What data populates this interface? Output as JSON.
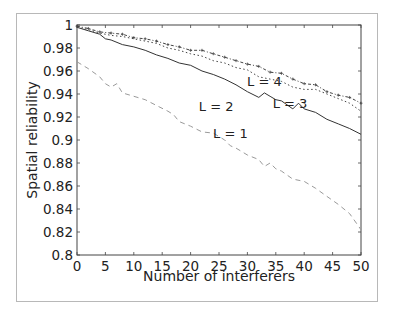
{
  "chart_data": {
    "type": "line",
    "title": "",
    "xlabel": "Number of interferers",
    "ylabel": "Spatial reliability",
    "xlim": [
      0,
      50
    ],
    "ylim": [
      0.8,
      1
    ],
    "xticks": [
      0,
      5,
      10,
      15,
      20,
      25,
      30,
      35,
      40,
      45,
      50
    ],
    "yticks": [
      0.8,
      0.82,
      0.84,
      0.86,
      0.88,
      0.9,
      0.92,
      0.94,
      0.96,
      0.98,
      1
    ],
    "ytick_labels": [
      "0.8",
      "0.82",
      "0.84",
      "0.86",
      "0.88",
      "0.9",
      "0.92",
      "0.94",
      "0.96",
      "0.98",
      "1"
    ],
    "grid": false,
    "legend": "inline labels",
    "series": [
      {
        "name": "L = 1",
        "style": "dashed",
        "color": "#9a9a9a",
        "label_pos": [
          27,
          0.902
        ],
        "x": [
          0,
          2,
          4,
          5,
          6,
          7,
          8,
          10,
          12,
          14,
          16,
          17,
          18,
          20,
          22,
          24,
          26,
          27,
          28,
          30,
          32,
          33,
          34,
          35,
          36,
          38,
          40,
          42,
          44,
          46,
          48,
          50
        ],
        "values": [
          0.968,
          0.962,
          0.955,
          0.949,
          0.946,
          0.949,
          0.941,
          0.938,
          0.935,
          0.93,
          0.925,
          0.922,
          0.916,
          0.912,
          0.907,
          0.906,
          0.9,
          0.895,
          0.893,
          0.887,
          0.883,
          0.877,
          0.88,
          0.875,
          0.873,
          0.866,
          0.864,
          0.858,
          0.851,
          0.844,
          0.836,
          0.822
        ]
      },
      {
        "name": "L = 2",
        "style": "solid",
        "color": "#333333",
        "label_pos": [
          24.5,
          0.925
        ],
        "x": [
          0,
          2,
          4,
          5,
          6,
          8,
          10,
          12,
          14,
          16,
          18,
          20,
          22,
          24,
          26,
          28,
          30,
          32,
          33,
          34,
          35,
          36,
          38,
          39,
          40,
          42,
          44,
          46,
          48,
          50
        ],
        "values": [
          0.998,
          0.995,
          0.992,
          0.988,
          0.987,
          0.983,
          0.981,
          0.978,
          0.974,
          0.971,
          0.967,
          0.965,
          0.96,
          0.957,
          0.953,
          0.948,
          0.942,
          0.937,
          0.941,
          0.938,
          0.935,
          0.934,
          0.927,
          0.932,
          0.927,
          0.924,
          0.918,
          0.914,
          0.91,
          0.905
        ]
      },
      {
        "name": "L = 3",
        "style": "dotted",
        "color": "#444444",
        "label_pos": [
          37.5,
          0.928
        ],
        "x": [
          0,
          2,
          4,
          6,
          8,
          10,
          12,
          14,
          16,
          18,
          20,
          22,
          24,
          26,
          28,
          30,
          32,
          34,
          36,
          38,
          40,
          42,
          44,
          46,
          48,
          50
        ],
        "values": [
          0.998,
          0.996,
          0.993,
          0.991,
          0.99,
          0.988,
          0.986,
          0.984,
          0.98,
          0.978,
          0.975,
          0.973,
          0.969,
          0.967,
          0.963,
          0.961,
          0.955,
          0.953,
          0.951,
          0.946,
          0.944,
          0.944,
          0.94,
          0.936,
          0.932,
          0.925
        ]
      },
      {
        "name": "L = 4",
        "style": "dash-dot-plus",
        "color": "#444444",
        "label_pos": [
          33,
          0.947
        ],
        "x": [
          0,
          2,
          4,
          6,
          8,
          10,
          12,
          14,
          16,
          18,
          20,
          22,
          24,
          26,
          28,
          30,
          32,
          34,
          36,
          38,
          40,
          42,
          44,
          46,
          48,
          50
        ],
        "values": [
          0.999,
          0.997,
          0.994,
          0.993,
          0.992,
          0.989,
          0.988,
          0.986,
          0.983,
          0.981,
          0.978,
          0.978,
          0.975,
          0.972,
          0.969,
          0.966,
          0.964,
          0.959,
          0.958,
          0.953,
          0.949,
          0.948,
          0.942,
          0.939,
          0.937,
          0.932
        ]
      }
    ]
  }
}
